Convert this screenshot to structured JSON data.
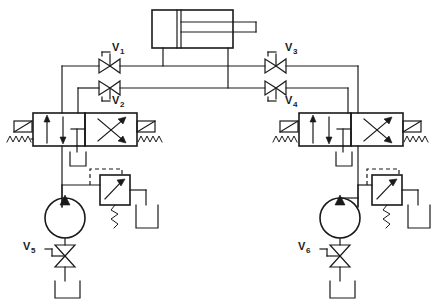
{
  "diagram": {
    "type": "hydraulic-schematic",
    "background_color": "#ffffff",
    "line_color": "#1a1a1a",
    "canvas": {
      "width": 436,
      "height": 305
    }
  },
  "labels": {
    "v1": {
      "base": "V",
      "sub": "1"
    },
    "v2": {
      "base": "V",
      "sub": "2"
    },
    "v3": {
      "base": "V",
      "sub": "3"
    },
    "v4": {
      "base": "V",
      "sub": "4"
    },
    "v5": {
      "base": "V",
      "sub": "5"
    },
    "v6": {
      "base": "V",
      "sub": "6"
    }
  },
  "components": [
    {
      "id": "cylinder",
      "name": "double-acting-cylinder",
      "symbol": "cylinder-with-rod",
      "rod_side": "right"
    },
    {
      "id": "v1",
      "name": "throttle-valve-v1",
      "symbol": "needle-valve",
      "orientation": "horizontal",
      "label": "V1"
    },
    {
      "id": "v2",
      "name": "throttle-valve-v2",
      "symbol": "needle-valve",
      "orientation": "horizontal",
      "label": "V2"
    },
    {
      "id": "v3",
      "name": "throttle-valve-v3",
      "symbol": "needle-valve",
      "orientation": "horizontal",
      "label": "V3"
    },
    {
      "id": "v4",
      "name": "throttle-valve-v4",
      "symbol": "needle-valve",
      "orientation": "horizontal",
      "label": "V4"
    },
    {
      "id": "v5",
      "name": "shutoff-valve-v5",
      "symbol": "shutoff-valve",
      "orientation": "vertical",
      "label": "V5"
    },
    {
      "id": "v6",
      "name": "shutoff-valve-v6",
      "symbol": "shutoff-valve",
      "orientation": "vertical",
      "label": "V6"
    },
    {
      "id": "dcv-left",
      "name": "directional-control-valve-left",
      "symbol": "4-way-2-position-valve",
      "actuator": "solenoid",
      "return": "spring"
    },
    {
      "id": "dcv-right",
      "name": "directional-control-valve-right",
      "symbol": "4-way-2-position-valve",
      "actuator": "solenoid",
      "return": "spring"
    },
    {
      "id": "pump-left",
      "name": "pump-left",
      "symbol": "fixed-displacement-pump"
    },
    {
      "id": "pump-right",
      "name": "pump-right",
      "symbol": "fixed-displacement-pump"
    },
    {
      "id": "relief-left",
      "name": "relief-valve-left",
      "symbol": "pressure-relief-valve",
      "pilot": "dashed"
    },
    {
      "id": "relief-right",
      "name": "relief-valve-right",
      "symbol": "pressure-relief-valve",
      "pilot": "dashed"
    },
    {
      "id": "tank-dcv-left",
      "name": "reservoir-dcv-left",
      "symbol": "tank"
    },
    {
      "id": "tank-dcv-right",
      "name": "reservoir-dcv-right",
      "symbol": "tank"
    },
    {
      "id": "tank-relief-left",
      "name": "reservoir-relief-left",
      "symbol": "tank"
    },
    {
      "id": "tank-relief-right",
      "name": "reservoir-relief-right",
      "symbol": "tank"
    },
    {
      "id": "tank-suction-left",
      "name": "reservoir-suction-left",
      "symbol": "tank"
    },
    {
      "id": "tank-suction-right",
      "name": "reservoir-suction-right",
      "symbol": "tank"
    }
  ]
}
